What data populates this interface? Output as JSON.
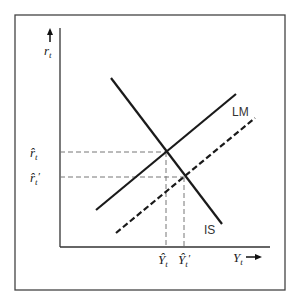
{
  "diagram": {
    "type": "IS-LM shift diagram",
    "y_axis_label": "r",
    "y_axis_sub": "t",
    "x_axis_label": "Y",
    "x_axis_sub": "t",
    "curves": [
      {
        "name": "IS",
        "label": "IS",
        "style": "solid"
      },
      {
        "name": "LM",
        "label": "LM",
        "style": "solid"
      },
      {
        "name": "LM-shifted",
        "label": "",
        "style": "dashed"
      }
    ],
    "y_ticks": [
      {
        "label": "r̂",
        "sub": "t",
        "prime": ""
      },
      {
        "label": "r̂",
        "sub": "t",
        "prime": "′"
      }
    ],
    "x_ticks": [
      {
        "label": "Ŷ",
        "sub": "t",
        "prime": ""
      },
      {
        "label": "Ŷ",
        "sub": "t",
        "prime": "′"
      }
    ],
    "colors": {
      "line": "#1a1a1a",
      "frame": "#444444",
      "guide": "#777777"
    }
  }
}
